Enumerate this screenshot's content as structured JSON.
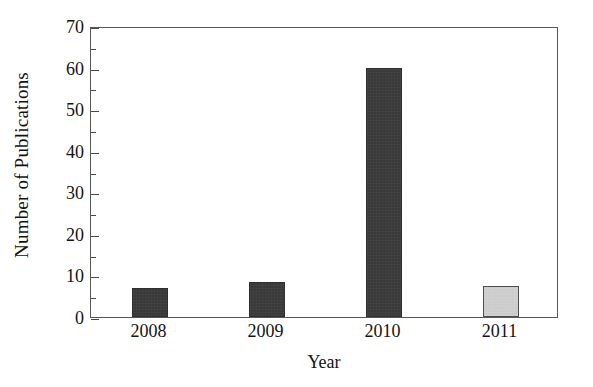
{
  "chart_data": {
    "type": "bar",
    "title": "",
    "subtitle": "",
    "xlabel": "Year",
    "ylabel": "Number of Publications",
    "categories": [
      "2008",
      "2009",
      "2010",
      "2011"
    ],
    "values": [
      7,
      8.5,
      60,
      7.5
    ],
    "series": [
      {
        "name": "Number of Publications",
        "values": [
          7,
          8.5,
          60,
          7.5
        ]
      }
    ],
    "bar_colors": [
      "#3a3a3a",
      "#3a3a3a",
      "#3a3a3a",
      "#d0d0d0"
    ],
    "bar_edge_colors": [
      "#2f2f2f",
      "#2f2f2f",
      "#2f2f2f",
      "#4d4d4d"
    ],
    "ylim": [
      0,
      70
    ],
    "xlim_categorical": true,
    "y_major_ticks": [
      0,
      10,
      20,
      30,
      40,
      50,
      60,
      70
    ],
    "y_minor_ticks": [
      5,
      15,
      25,
      35,
      45,
      55,
      65
    ],
    "y_tick_labels": [
      "0",
      "10",
      "20",
      "30",
      "40",
      "50",
      "60",
      "70"
    ],
    "x_tick_labels": [
      "2008",
      "2009",
      "2010",
      "2011"
    ],
    "grid": false,
    "legend": null,
    "legend_position": "none",
    "frame": "full-box",
    "tick_direction": "in",
    "annotations": []
  },
  "colors": {
    "background": "#ffffff",
    "axis_line": "#575757",
    "tick_mark": "#4a4a4a",
    "text": "#141414",
    "bar_dark": "#3a3a3a",
    "bar_light": "#d0d0d0"
  }
}
